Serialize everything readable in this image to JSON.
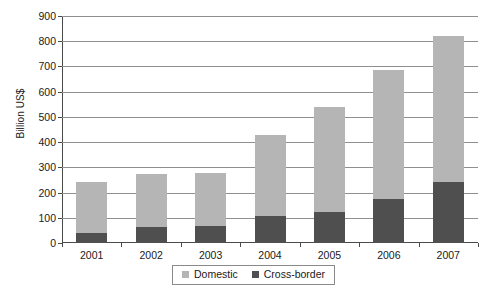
{
  "chart_data": {
    "type": "bar",
    "subtype": "stacked-vertical",
    "title": "",
    "xlabel": "",
    "ylabel": "Billion US$",
    "categories": [
      "2001",
      "2002",
      "2003",
      "2004",
      "2005",
      "2006",
      "2007"
    ],
    "series": [
      {
        "name": "Cross-border",
        "color": "#4f4f4f",
        "values": [
          40,
          63,
          68,
          108,
          122,
          175,
          240
        ]
      },
      {
        "name": "Domestic",
        "color": "#b5b5b5",
        "values": [
          200,
          209,
          209,
          322,
          418,
          510,
          580
        ]
      }
    ],
    "totals": [
      240,
      272,
      277,
      430,
      540,
      685,
      820
    ],
    "stack_order": [
      "Cross-border",
      "Domestic"
    ],
    "ylim": [
      0,
      900
    ],
    "ytick_values": [
      0,
      100,
      200,
      300,
      400,
      500,
      600,
      700,
      800,
      900
    ],
    "ytick_labels": [
      "0",
      "100",
      "200",
      "300",
      "400",
      "500",
      "600",
      "700",
      "800",
      "900"
    ],
    "grid": true,
    "grid_axis": "y",
    "legend_position": "bottom-center",
    "legend_entries": [
      {
        "label": "Domestic",
        "color": "#b5b5b5"
      },
      {
        "label": "Cross-border",
        "color": "#4f4f4f"
      }
    ]
  }
}
